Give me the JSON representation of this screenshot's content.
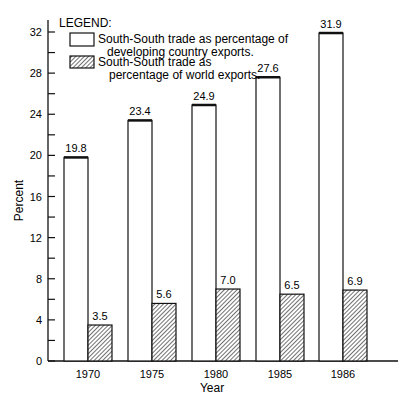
{
  "chart_data": {
    "type": "bar",
    "title": "",
    "xlabel": "Year",
    "ylabel": "Percent",
    "ylim": [
      0,
      32
    ],
    "yticks": [
      0,
      4,
      8,
      12,
      16,
      20,
      24,
      28,
      32
    ],
    "grid": false,
    "legend_position": "top-left",
    "legend_title": "LEGEND:",
    "categories": [
      "1970",
      "1975",
      "1980",
      "1985",
      "1986"
    ],
    "series": [
      {
        "name": "South-South trade as percentage of developing country exports.",
        "legend_lines": [
          "South-South trade as percentage of",
          "developing country exports."
        ],
        "fill": "white",
        "values": [
          19.8,
          23.4,
          24.9,
          27.6,
          31.9
        ]
      },
      {
        "name": "South-South trade as percentage of world exports.",
        "legend_lines": [
          "South-South trade as",
          "percentage of world exports."
        ],
        "fill": "hatched",
        "values": [
          3.5,
          5.6,
          7.0,
          6.5,
          6.9
        ]
      }
    ],
    "value_labels": [
      [
        "19.8",
        "23.4",
        "24.9",
        "27.6",
        "31.9"
      ],
      [
        "3.5",
        "5.6",
        "7.0",
        "6.5",
        "6.9"
      ]
    ]
  }
}
